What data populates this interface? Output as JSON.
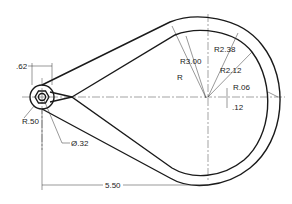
{
  "drawing": {
    "type": "engineering-drawing",
    "subject": "teardrop cam/lever plate with hexagonal hub",
    "dimensions": {
      "hub_width": ".62",
      "hub_radius": "R.50",
      "hole_diameter": "Ø.32",
      "center_distance": "5.50",
      "outer_radius_1": "R3.00",
      "outer_radius_2": "R2.38",
      "inner_radius": "R2.12",
      "unlabeled_radius": "R",
      "fillet_radius": "R.06",
      "offset": ".12"
    },
    "colors": {
      "line": "#1a1a1a",
      "background": "#ffffff"
    }
  }
}
